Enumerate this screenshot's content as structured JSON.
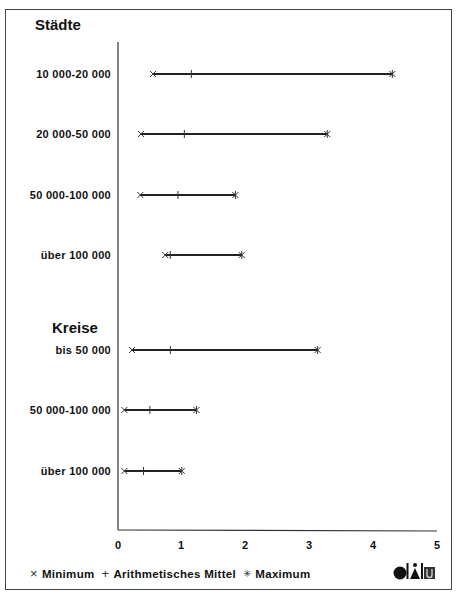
{
  "chart_data": {
    "type": "range-dot",
    "title": "",
    "xlabel": "",
    "ylabel": "",
    "xlim": [
      0,
      5
    ],
    "x_ticks": [
      "0",
      "1",
      "2",
      "3",
      "4",
      "5"
    ],
    "grid": false,
    "legend_position": "bottom",
    "groups": [
      {
        "name": "Städte",
        "rows": [
          {
            "label": "10 000-20 000",
            "min": 0.55,
            "mean": 1.15,
            "max": 4.3
          },
          {
            "label": "20 000-50 000",
            "min": 0.36,
            "mean": 1.04,
            "max": 3.28
          },
          {
            "label": "50 000-100 000",
            "min": 0.35,
            "mean": 0.94,
            "max": 1.84
          },
          {
            "label": "über 100 000",
            "min": 0.74,
            "mean": 0.82,
            "max": 1.94
          }
        ]
      },
      {
        "name": "Kreise",
        "rows": [
          {
            "label": "bis 50 000",
            "min": 0.22,
            "mean": 0.82,
            "max": 3.13
          },
          {
            "label": "50 000-100 000",
            "min": 0.1,
            "mean": 0.5,
            "max": 1.23
          },
          {
            "label": "über 100 000",
            "min": 0.1,
            "mean": 0.4,
            "max": 1.0
          }
        ]
      }
    ],
    "legend": [
      {
        "symbol": "×",
        "label": "Minimum"
      },
      {
        "symbol": "+",
        "label": "Arithmetisches Mittel"
      },
      {
        "symbol": "✳",
        "label": "Maximum"
      }
    ]
  },
  "groups": {
    "staedte": {
      "title": "Städte",
      "labels": [
        "10 000-20 000",
        "20 000-50 000",
        "50 000-100 000",
        "über 100 000"
      ]
    },
    "kreise": {
      "title": "Kreise",
      "labels": [
        "bis 50 000",
        "50 000-100 000",
        "über 100 000"
      ]
    }
  },
  "axis": {
    "ticks": [
      "0",
      "1",
      "2",
      "3",
      "4",
      "5"
    ]
  },
  "legend": {
    "min_symbol": "×",
    "min_label": "Minimum",
    "mean_symbol": "+",
    "mean_label": "Arithmetisches Mittel",
    "max_symbol": "✳",
    "max_label": "Maximum"
  },
  "logo": {
    "name": "difu-logo"
  },
  "colors": {
    "line": "#222222",
    "frame": "#444444",
    "text": "#111111"
  }
}
